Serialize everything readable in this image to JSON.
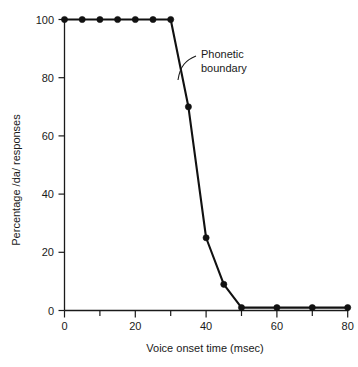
{
  "chart_data": {
    "type": "line",
    "title": "",
    "xlabel": "Voice onset time (msec)",
    "ylabel": "Percentage /da/ responses",
    "xlim": [
      0,
      80
    ],
    "ylim": [
      0,
      100
    ],
    "grid": false,
    "legend": "none",
    "x": [
      0,
      5,
      10,
      15,
      20,
      25,
      30,
      35,
      40,
      45,
      50,
      60,
      70,
      80
    ],
    "values": [
      100,
      100,
      100,
      100,
      100,
      100,
      100,
      70,
      25,
      9,
      1,
      1,
      1,
      1
    ],
    "series": [
      {
        "name": "Percentage /da/ responses",
        "values": [
          100,
          100,
          100,
          100,
          100,
          100,
          100,
          70,
          25,
          9,
          1,
          1,
          1,
          1
        ]
      }
    ],
    "xticks": [
      0,
      20,
      40,
      60,
      80
    ],
    "xtick_labels": [
      "0",
      "20",
      "40",
      "60",
      "80"
    ],
    "xminor_ticks": [
      10,
      30,
      50,
      70
    ],
    "yticks": [
      0,
      20,
      40,
      60,
      80,
      100
    ],
    "ytick_labels": [
      "0",
      "20",
      "40",
      "60",
      "80",
      "100"
    ],
    "marker": "filled-circle",
    "line_color": "#111111",
    "annotations": [
      {
        "text_line_1": "Phonetic",
        "text_line_2": "boundary",
        "points_to_x": 34,
        "points_to_y": 78
      }
    ]
  }
}
